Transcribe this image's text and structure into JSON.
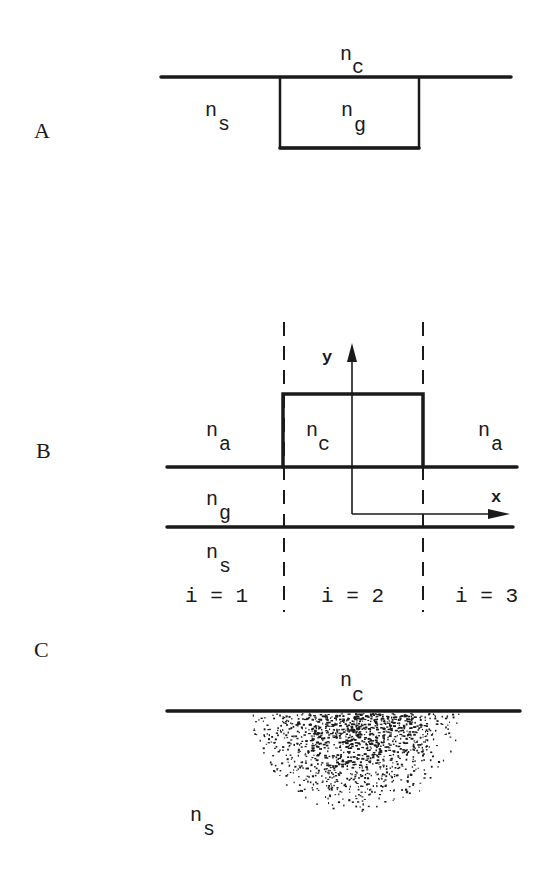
{
  "panels": {
    "A": {
      "letter": "A",
      "cover_index": {
        "base": "n",
        "sub": "c"
      },
      "substrate_index": {
        "base": "n",
        "sub": "s"
      },
      "guide_index": {
        "base": "n",
        "sub": "g"
      }
    },
    "B": {
      "letter": "B",
      "left_index": {
        "base": "n",
        "sub": "a"
      },
      "core_index": {
        "base": "n",
        "sub": "c"
      },
      "right_index": {
        "base": "n",
        "sub": "a"
      },
      "guide_index": {
        "base": "n",
        "sub": "g"
      },
      "substrate_index": {
        "base": "n",
        "sub": "s"
      },
      "axis_y_label": "y",
      "axis_x_label": "x",
      "regions": [
        "i = 1",
        "i = 2",
        "i = 3"
      ]
    },
    "C": {
      "letter": "C",
      "cover_index": {
        "base": "n",
        "sub": "c"
      },
      "substrate_index": {
        "base": "n",
        "sub": "s"
      }
    }
  },
  "colors": {
    "ink": "#1a1a1a",
    "paper": "#ffffff"
  }
}
